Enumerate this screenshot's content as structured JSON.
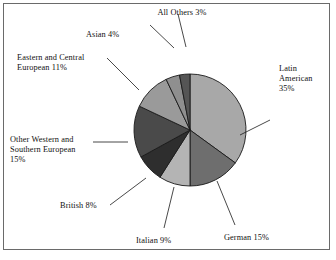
{
  "figure": {
    "width": 336,
    "height": 260,
    "background": "#ffffff",
    "frame_color": "#6a6a6a"
  },
  "chart_data": {
    "type": "pie",
    "title": "",
    "subtitle": "",
    "xlabel": "",
    "ylabel": "",
    "grid": false,
    "legend_position": "none",
    "labels_placement": "outside-with-leader-lines",
    "units": "percent",
    "start_angle_deg": 0,
    "direction": "clockwise",
    "categories": [
      "Latin American",
      "German",
      "Italian",
      "British",
      "Other Western and Southern European",
      "Eastern and Central European",
      "Asian",
      "All Others"
    ],
    "values": [
      35,
      15,
      9,
      8,
      15,
      11,
      4,
      3
    ],
    "colors": [
      "#a8a8a8",
      "#6e6e6e",
      "#b4b4b4",
      "#2e2e2e",
      "#4a4a4a",
      "#9a9a9a",
      "#8f8f8f",
      "#555555"
    ],
    "slice_edge_color": "#1a1a1a",
    "annotations": [
      {
        "text": "All Others 3%",
        "category": "All Others",
        "value": 3
      },
      {
        "text": "Asian 4%",
        "category": "Asian",
        "value": 4
      },
      {
        "text": "Eastern and Central European 11%",
        "category": "Eastern and Central European",
        "value": 11
      },
      {
        "text": "Other Western and Southern European 15%",
        "category": "Other Western and Southern European",
        "value": 15
      },
      {
        "text": "British 8%",
        "category": "British",
        "value": 8
      },
      {
        "text": "Italian 9%",
        "category": "Italian",
        "value": 9
      },
      {
        "text": "German 15%",
        "category": "German",
        "value": 15
      },
      {
        "text": "Latin American 35%",
        "category": "Latin American",
        "value": 35
      }
    ]
  },
  "labels": {
    "all_others": "All Others 3%",
    "asian": "Asian 4%",
    "eastern_line1": "Eastern and Central",
    "eastern_line2": "European 11%",
    "other_western_line1": "Other Western and",
    "other_western_line2": "Southern European",
    "other_western_line3": "15%",
    "british": "British 8%",
    "italian": "Italian 9%",
    "german": "German 15%",
    "latin_line1": "Latin",
    "latin_line2": "American",
    "latin_line3": "35%"
  }
}
